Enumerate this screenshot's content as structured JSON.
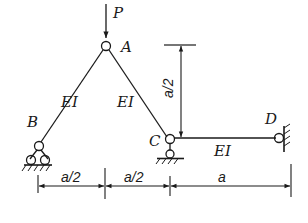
{
  "diagram": {
    "type": "structural-frame",
    "load": {
      "label": "P",
      "direction": "down",
      "at": "A"
    },
    "nodes": [
      {
        "id": "A",
        "label": "A",
        "type": "hinge"
      },
      {
        "id": "B",
        "label": "B",
        "type": "roller-support"
      },
      {
        "id": "C",
        "label": "C",
        "type": "pin-support-hinge"
      },
      {
        "id": "D",
        "label": "D",
        "type": "hinge-wall"
      }
    ],
    "members": [
      {
        "from": "B",
        "to": "A",
        "label": "EI"
      },
      {
        "from": "A",
        "to": "C",
        "label": "EI"
      },
      {
        "from": "C",
        "to": "D",
        "label": "EI"
      }
    ],
    "dimensions": {
      "horizontal": [
        "a/2",
        "a/2",
        "a"
      ],
      "vertical": "a/2"
    },
    "colors": {
      "line": "#1a1a1a",
      "background": "#ffffff"
    }
  }
}
